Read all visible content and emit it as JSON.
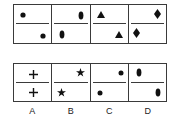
{
  "puzzle": {
    "question_row": [
      {
        "index": 1,
        "top": {
          "shape": "dot",
          "pos": "left"
        },
        "bottom": {
          "shape": "dot",
          "pos": "right"
        }
      },
      {
        "index": 2,
        "top": {
          "shape": "oval",
          "pos": "right"
        },
        "bottom": {
          "shape": "oval",
          "pos": "left"
        }
      },
      {
        "index": 3,
        "top": {
          "shape": "triangle",
          "pos": "left"
        },
        "bottom": {
          "shape": "triangle",
          "pos": "right"
        }
      },
      {
        "index": 4,
        "top": {
          "shape": "diamond",
          "pos": "right"
        },
        "bottom": {
          "shape": "diamond",
          "pos": "left"
        }
      }
    ],
    "options": [
      {
        "label": "A",
        "top": {
          "shape": "plus",
          "pos": "center"
        },
        "bottom": {
          "shape": "plus",
          "pos": "center"
        }
      },
      {
        "label": "B",
        "top": {
          "shape": "star",
          "pos": "right"
        },
        "bottom": {
          "shape": "star",
          "pos": "left"
        }
      },
      {
        "label": "C",
        "top": {
          "shape": "dot",
          "pos": "right"
        },
        "bottom": {
          "shape": "dot",
          "pos": "left"
        }
      },
      {
        "label": "D",
        "top": {
          "shape": "oval",
          "pos": "left"
        },
        "bottom": {
          "shape": "oval",
          "pos": "right"
        }
      }
    ],
    "colors": {
      "line": "#3a3a3a",
      "shape": "#111111",
      "background": "#ffffff"
    }
  }
}
